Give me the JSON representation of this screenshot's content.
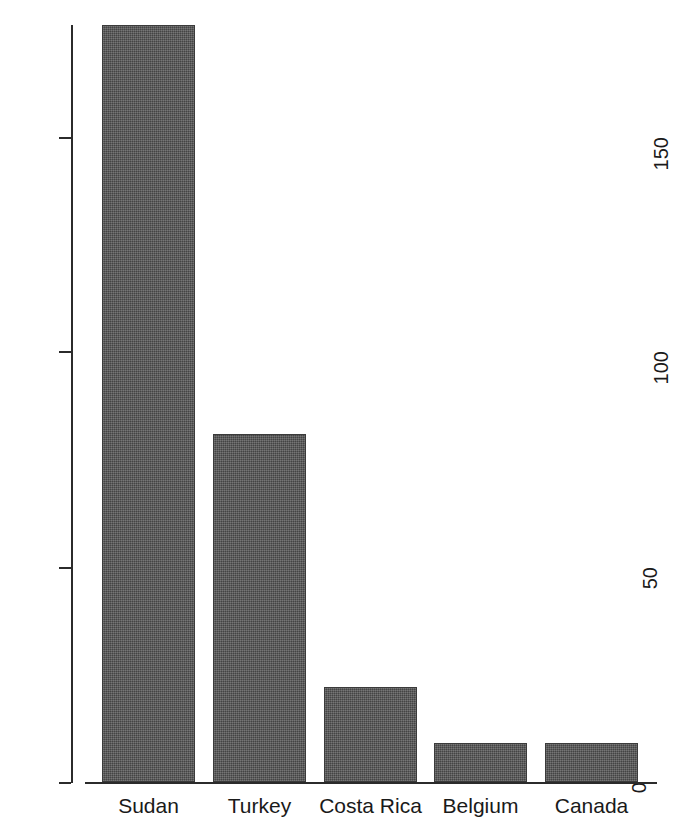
{
  "chart_data": {
    "type": "bar",
    "title": "",
    "subtitle": "",
    "xlabel": "",
    "ylabel": "",
    "categories": [
      "Sudan",
      "Turkey",
      "Costa Rica",
      "Belgium",
      "Canada"
    ],
    "values": [
      176,
      81,
      22,
      9,
      9
    ],
    "series": [
      {
        "name": "",
        "values": [
          176,
          81,
          22,
          9,
          9
        ]
      }
    ],
    "ylim": [
      0,
      176
    ],
    "yticks": [
      0,
      50,
      100,
      150
    ],
    "ytick_labels": [
      "0",
      "50",
      "100",
      "150"
    ],
    "ytick_label_rotation": "90",
    "xticks": [],
    "grid": "off",
    "legend": "none",
    "bar_color": "#555555",
    "bar_edge_color": "#3b3b3b",
    "axis_color": "#2b2b2b",
    "background_color": "#ffffff"
  },
  "axes": {
    "y_axis_name": "y-axis",
    "x_axis_name": "x-axis"
  }
}
